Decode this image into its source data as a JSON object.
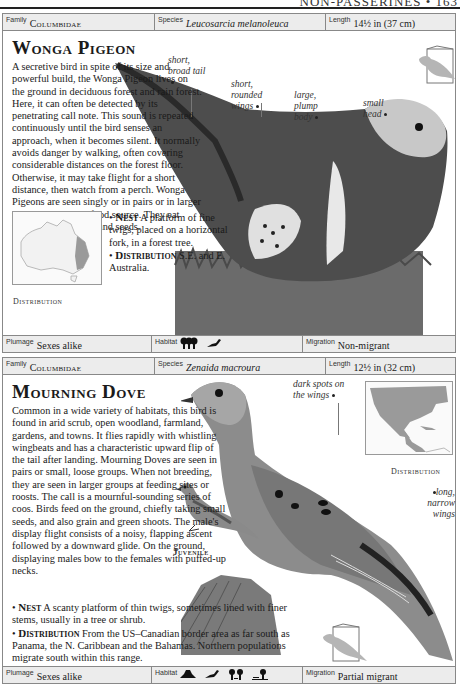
{
  "page": {
    "running_head": "NON-PASSERINES • 163"
  },
  "entries": [
    {
      "family_label": "Family",
      "family": "Columbidae",
      "species_label": "Species",
      "species": "Leucosarcia melanoleuca",
      "length_label": "Length",
      "length": "14½ in (37 cm)",
      "title": "Wonga Pigeon",
      "description": "A secretive bird in spite of its size and powerful build, the Wonga Pigeon lives on the ground in deciduous forest and rain forest. Here, it can often be detected by its penetrating call note. This sound is repeated continuously until the bird senses an approach, when it becomes silent. It normally avoids danger by walking, often covering considerable distances on the forest floor. Otherwise, it may take flight for a short distance, then watch from a perch. Wonga Pigeons are seen singly or in pairs or in larger numbers at a good food source. They eat fallen fruits, berries, and seeds.",
      "nest_heading": "Nest",
      "nest": "A platform of fine twigs, placed on a horizontal fork, in a forest tree.",
      "distribution_heading": "Distribution",
      "distribution": "S.E. and E. Australia.",
      "map_label": "Distribution",
      "annotations": [
        "short, broad tail",
        "short, rounded wings",
        "large, plump body",
        "small head"
      ],
      "plumage_label": "Plumage",
      "plumage": "Sexes alike",
      "habitat_label": "Habitat",
      "habitat_icons": [
        "forest-icon",
        "perching-bird-icon"
      ],
      "migration_label": "Migration",
      "migration": "Non-migrant"
    },
    {
      "family_label": "Family",
      "family": "Columbidae",
      "species_label": "Species",
      "species": "Zenaida macroura",
      "length_label": "Length",
      "length": "12½ in (32 cm)",
      "title": "Mourning Dove",
      "description": "Common in a wide variety of habitats, this bird is found in arid scrub, open woodland, farmland, gardens, and towns. It flies rapidly with whistling wingbeats and has a characteristic upward flip of the tail after landing. Mourning Doves are seen in pairs or small, loose groups. When not breeding, they are seen in larger groups at feeding sites or roosts. The call is a mournful-sounding series of coos. Birds feed on the ground, chiefly taking small seeds, and also grain and green shoots. The male's display flight consists of a noisy, flapping ascent followed by a downward glide. On the ground, displaying males bow to the females with puffed-up necks.",
      "nest_heading": "Nest",
      "nest": "A scanty platform of thin twigs, sometimes lined with finer stems, usually in a tree or shrub.",
      "distribution_heading": "Distribution",
      "distribution": "From the US–Canadian border area as far south as Panama, the N. Caribbean and the Bahamas. Northern populations migrate south within this range.",
      "map_label": "Distribution",
      "juvenile_label": "Juvenile",
      "annotations": [
        "dark spots on the wings",
        "long, narrow wings"
      ],
      "plumage_label": "Plumage",
      "plumage": "Sexes alike",
      "habitat_label": "Habitat",
      "habitat_icons": [
        "scrub-icon",
        "perching-bird-icon",
        "woodland-icon",
        "farmland-icon"
      ],
      "migration_label": "Migration",
      "migration": "Partial migrant"
    }
  ]
}
